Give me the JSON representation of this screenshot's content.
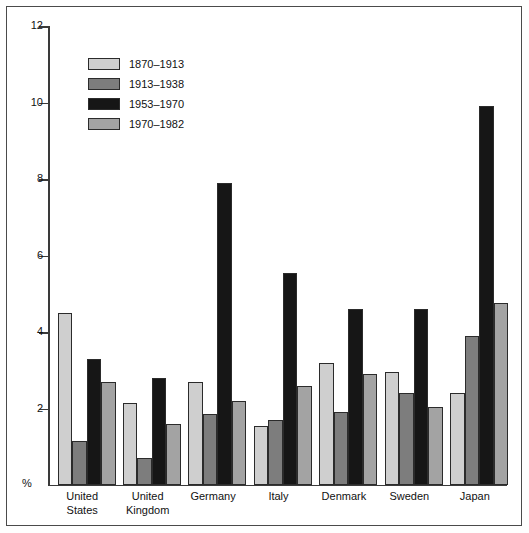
{
  "chart_data": {
    "type": "bar",
    "title": "",
    "subtitle": "",
    "xlabel": "",
    "ylabel": "%",
    "ylim": [
      0,
      12
    ],
    "yticks": [
      2,
      4,
      6,
      8,
      10,
      12
    ],
    "grid": false,
    "legend_position": "top-left inside plot",
    "categories": [
      "United States",
      "United Kingdom",
      "Germany",
      "Italy",
      "Denmark",
      "Sweden",
      "Japan"
    ],
    "category_lines": [
      [
        "United",
        "States"
      ],
      [
        "United",
        "Kingdom"
      ],
      [
        "Germany"
      ],
      [
        "Italy"
      ],
      [
        "Denmark"
      ],
      [
        "Sweden"
      ],
      [
        "Japan"
      ]
    ],
    "series": [
      {
        "name": "1870–1913",
        "color": "#cfcfcf",
        "values": [
          4.5,
          2.15,
          2.7,
          1.55,
          3.2,
          2.95,
          2.4
        ]
      },
      {
        "name": "1913–1938",
        "color": "#7d7d7d",
        "values": [
          1.15,
          0.7,
          1.85,
          1.7,
          1.9,
          2.4,
          3.9
        ]
      },
      {
        "name": "1953–1970",
        "color": "#161616",
        "values": [
          3.3,
          2.8,
          7.9,
          5.55,
          4.6,
          4.6,
          9.9
        ]
      },
      {
        "name": "1970–1982",
        "color": "#a3a3a3",
        "values": [
          2.7,
          1.6,
          2.2,
          2.6,
          2.9,
          2.05,
          4.75
        ]
      }
    ]
  },
  "axis": {
    "y_unit_label": "%",
    "tick_labels": [
      "12",
      "10",
      "8",
      "6",
      "4",
      "2"
    ]
  },
  "colors": {
    "series_1": "#cfcfcf",
    "series_2": "#7d7d7d",
    "series_3": "#161616",
    "series_4": "#a3a3a3",
    "axis": "#3a3a3a",
    "frame": "#4a4a4a",
    "background": "#ffffff"
  }
}
